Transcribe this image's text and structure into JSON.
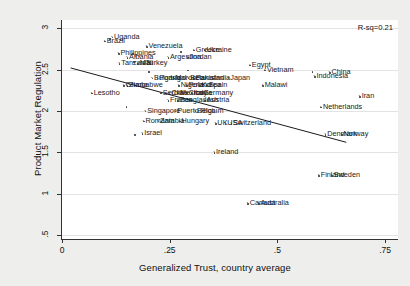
{
  "chart_data": {
    "type": "scatter",
    "title": "",
    "xlabel": "Generalized Trust, country average",
    "ylabel": "Product Market Regulation",
    "xlim": [
      0,
      0.78
    ],
    "ylim": [
      0.45,
      3.1
    ],
    "xticks": [
      "0",
      ".25",
      ".5",
      ".75"
    ],
    "xtickvals": [
      0,
      0.25,
      0.5,
      0.75
    ],
    "yticks": [
      ".5",
      "1",
      "1.5",
      "2",
      "2.5",
      "3"
    ],
    "ytickvals": [
      0.5,
      1,
      1.5,
      2,
      2.5,
      3
    ],
    "grid": "horizontal",
    "legend": "none",
    "annotation": "R-sq=0.21",
    "fit_line": {
      "x0": 0.02,
      "y0": 2.52,
      "x1": 0.66,
      "y1": 1.62
    },
    "points": [
      {
        "label": "Uganda",
        "x": 0.115,
        "y": 2.9
      },
      {
        "label": "Brazil",
        "x": 0.098,
        "y": 2.85
      },
      {
        "label": "Venezuela",
        "x": 0.195,
        "y": 2.78
      },
      {
        "label": "Greece",
        "x": 0.305,
        "y": 2.74
      },
      {
        "label": "Ukraine",
        "x": 0.33,
        "y": 2.74
      },
      {
        "label": "Philippines",
        "x": 0.13,
        "y": 2.7
      },
      {
        "label": "Albania",
        "x": 0.15,
        "y": 2.65
      },
      {
        "label": "Argentina",
        "x": 0.245,
        "y": 2.65
      },
      {
        "label": "Jordan",
        "x": 0.29,
        "y": 2.65
      },
      {
        "label": "Tanzania",
        "x": 0.132,
        "y": 2.58
      },
      {
        "label": "Mali",
        "x": 0.175,
        "y": 2.58
      },
      {
        "label": "Turkey",
        "x": 0.188,
        "y": 2.58
      },
      {
        "label": "Egypt",
        "x": 0.435,
        "y": 2.56
      },
      {
        "label": "Vietnam",
        "x": 0.47,
        "y": 2.5
      },
      {
        "label": "China",
        "x": 0.62,
        "y": 2.47
      },
      {
        "label": "Indonesia",
        "x": 0.585,
        "y": 2.42
      },
      {
        "label": "Bulgaria",
        "x": 0.208,
        "y": 2.4
      },
      {
        "label": "Portugal",
        "x": 0.22,
        "y": 2.4
      },
      {
        "label": "Morocco",
        "x": 0.258,
        "y": 2.4
      },
      {
        "label": "Belarus",
        "x": 0.292,
        "y": 2.4
      },
      {
        "label": "Pakistan",
        "x": 0.305,
        "y": 2.4
      },
      {
        "label": "India",
        "x": 0.348,
        "y": 2.4
      },
      {
        "label": "Japan",
        "x": 0.385,
        "y": 2.4
      },
      {
        "label": "Zimbabwe",
        "x": 0.15,
        "y": 2.31
      },
      {
        "label": "Ghana",
        "x": 0.142,
        "y": 2.31
      },
      {
        "label": "Nigeria",
        "x": 0.27,
        "y": 2.31
      },
      {
        "label": "Poland",
        "x": 0.288,
        "y": 2.31
      },
      {
        "label": "Korea",
        "x": 0.318,
        "y": 2.31
      },
      {
        "label": "Spain",
        "x": 0.335,
        "y": 2.31
      },
      {
        "label": "Malawi",
        "x": 0.465,
        "y": 2.31
      },
      {
        "label": "Lesotho",
        "x": 0.068,
        "y": 2.22
      },
      {
        "label": "Serbia",
        "x": 0.228,
        "y": 2.22
      },
      {
        "label": "Chile",
        "x": 0.248,
        "y": 2.22
      },
      {
        "label": "Mexico",
        "x": 0.268,
        "y": 2.22
      },
      {
        "label": "Croatia",
        "x": 0.288,
        "y": 2.22
      },
      {
        "label": "Italy",
        "x": 0.3,
        "y": 2.22
      },
      {
        "label": "Germany",
        "x": 0.322,
        "y": 2.22
      },
      {
        "label": "France",
        "x": 0.245,
        "y": 2.13
      },
      {
        "label": "Bangladesh",
        "x": 0.268,
        "y": 2.13
      },
      {
        "label": "Austria",
        "x": 0.33,
        "y": 2.13
      },
      {
        "label": "Iran",
        "x": 0.69,
        "y": 2.18
      },
      {
        "label": "Singapore",
        "x": 0.192,
        "y": 2.0
      },
      {
        "label": "Puerto Rico",
        "x": 0.262,
        "y": 2.0
      },
      {
        "label": "Belgium",
        "x": 0.308,
        "y": 2.0
      },
      {
        "label": "Netherlands",
        "x": 0.6,
        "y": 2.05
      },
      {
        "label": "Romania",
        "x": 0.188,
        "y": 1.88
      },
      {
        "label": "Zambia",
        "x": 0.222,
        "y": 1.88
      },
      {
        "label": "Hungary",
        "x": 0.272,
        "y": 1.88
      },
      {
        "label": "UK",
        "x": 0.355,
        "y": 1.85
      },
      {
        "label": "USA",
        "x": 0.378,
        "y": 1.85
      },
      {
        "label": "Switzerland",
        "x": 0.392,
        "y": 1.85
      },
      {
        "label": "Israel",
        "x": 0.185,
        "y": 1.73
      },
      {
        "label": "Denmark",
        "x": 0.61,
        "y": 1.72
      },
      {
        "label": "Norway",
        "x": 0.648,
        "y": 1.72
      },
      {
        "label": "Ireland",
        "x": 0.352,
        "y": 1.5
      },
      {
        "label": "Finland",
        "x": 0.595,
        "y": 1.22
      },
      {
        "label": "Sweden",
        "x": 0.625,
        "y": 1.22
      },
      {
        "label": "Canada",
        "x": 0.43,
        "y": 0.88
      },
      {
        "label": "Australia",
        "x": 0.455,
        "y": 0.88
      }
    ],
    "unlabeled_points": [
      {
        "x": 0.11,
        "y": 2.88
      },
      {
        "x": 0.163,
        "y": 2.7
      },
      {
        "x": 0.275,
        "y": 2.72
      },
      {
        "x": 0.165,
        "y": 2.6
      },
      {
        "x": 0.2,
        "y": 2.48
      },
      {
        "x": 0.29,
        "y": 2.5
      },
      {
        "x": 0.58,
        "y": 2.48
      },
      {
        "x": 0.148,
        "y": 2.06
      },
      {
        "x": 0.168,
        "y": 1.72
      }
    ]
  }
}
